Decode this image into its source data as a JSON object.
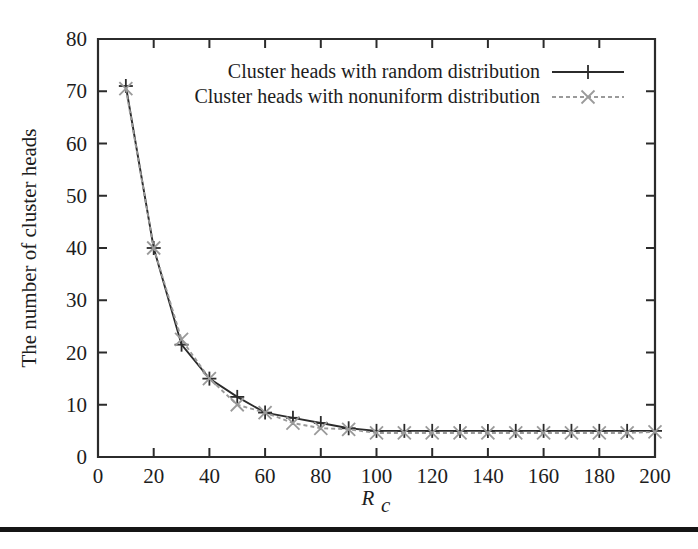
{
  "figure": {
    "background_color": "#ffffff",
    "bottom_rule": {
      "color": "#151515",
      "y": 527,
      "height": 5
    }
  },
  "chart_data": {
    "type": "line",
    "title": "",
    "subtitle": "",
    "xlabel": "R_c",
    "xlabel_base": "R",
    "xlabel_sub": "c",
    "ylabel": "The number of cluster heads",
    "xlim": [
      0,
      200
    ],
    "ylim": [
      0,
      80
    ],
    "xticks": [
      0,
      20,
      40,
      60,
      80,
      100,
      120,
      140,
      160,
      180,
      200
    ],
    "xtick_labels": [
      "0",
      "20",
      "40",
      "60",
      "80",
      "100",
      "120",
      "140",
      "160",
      "180",
      "200"
    ],
    "yticks": [
      0,
      10,
      20,
      30,
      40,
      50,
      60,
      70,
      80
    ],
    "ytick_labels": [
      "0",
      "10",
      "20",
      "30",
      "40",
      "50",
      "60",
      "70",
      "80"
    ],
    "grid": false,
    "legend_position": "top-center",
    "x": [
      10,
      20,
      30,
      40,
      50,
      60,
      70,
      80,
      90,
      100,
      110,
      120,
      130,
      140,
      150,
      160,
      170,
      180,
      190,
      200
    ],
    "series": [
      {
        "name": "Cluster heads with random distribution",
        "marker": "plus",
        "color": "#2b2b2b",
        "line_style": "solid",
        "values": [
          71,
          40,
          21.5,
          15,
          11.5,
          8.5,
          7.5,
          6.5,
          5.5,
          5,
          5,
          5,
          5,
          5,
          5,
          5,
          5,
          5,
          5,
          5
        ]
      },
      {
        "name": "Cluster heads with nonuniform distribution",
        "marker": "cross",
        "color": "#9a9a9a",
        "line_style": "dashed",
        "values": [
          70.5,
          40,
          22.5,
          15,
          10,
          8.5,
          6.5,
          5.5,
          5.3,
          4.6,
          4.6,
          4.6,
          4.6,
          4.6,
          4.6,
          4.6,
          4.6,
          4.6,
          4.6,
          4.8
        ]
      }
    ]
  }
}
